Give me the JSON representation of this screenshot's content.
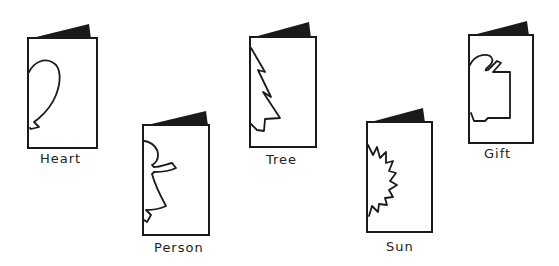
{
  "figure": {
    "colors": {
      "ink": "#1a1a1a",
      "paper": "#ffffff"
    },
    "cards": [
      {
        "id": "heart",
        "label": "Heart",
        "shape": "half-heart"
      },
      {
        "id": "person",
        "label": "Person",
        "shape": "half-person"
      },
      {
        "id": "tree",
        "label": "Tree",
        "shape": "half-tree"
      },
      {
        "id": "sun",
        "label": "Sun",
        "shape": "half-sun"
      },
      {
        "id": "gift",
        "label": "Gift",
        "shape": "half-gift"
      }
    ]
  }
}
